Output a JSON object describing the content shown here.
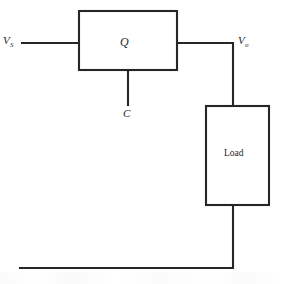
{
  "diagram": {
    "type": "circuit-block-diagram",
    "background_color": "#ffffff",
    "line_color": "#262626",
    "blocks": [
      {
        "id": "switch",
        "label": "Q",
        "style": "italic",
        "shape": "rectangle",
        "x": 79,
        "y": 11,
        "width": 98,
        "height": 59
      },
      {
        "id": "load",
        "label": "Load",
        "style": "roman",
        "shape": "rectangle",
        "x": 206,
        "y": 106,
        "width": 63,
        "height": 99
      }
    ],
    "terminals": [
      {
        "id": "source",
        "label": "V",
        "subscript": "S",
        "x": 22,
        "y": 43,
        "side": "left"
      },
      {
        "id": "control",
        "label": "C",
        "subscript": "",
        "x": 128,
        "y": 105,
        "side": "bottom"
      },
      {
        "id": "output",
        "label": "V",
        "subscript": "o",
        "x": 233,
        "y": 43,
        "side": "right"
      }
    ],
    "wires": [
      {
        "id": "input-wire",
        "from": "source-terminal",
        "to": "switch-left",
        "path": "M 22 43 L 79 43"
      },
      {
        "id": "control-stub",
        "from": "switch-bottom",
        "to": "control-terminal",
        "path": "M 128 70 L 128 105"
      },
      {
        "id": "output-wire",
        "from": "switch-right",
        "to": "load-top",
        "path": "M 177 43 L 233 43 L 233 106"
      },
      {
        "id": "return-wire",
        "from": "load-bottom",
        "to": "ground-rail",
        "path": "M 233 205 L 233 268 L 20 268"
      }
    ]
  }
}
